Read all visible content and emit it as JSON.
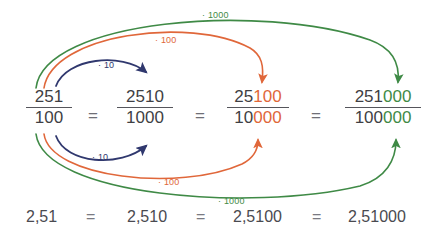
{
  "figure": {
    "colors": {
      "text": "#3f3f44",
      "equals": "#6f6f76",
      "blue": "#30386e",
      "orange": "#e0673a",
      "green": "#3f8a46",
      "background": "#ffffff"
    }
  },
  "fractions": [
    {
      "num_plain": "251",
      "num_colored": "",
      "num_color": "",
      "den_plain": "100",
      "den_colored": "",
      "den_color": ""
    },
    {
      "num_plain": "2510",
      "num_colored": "",
      "num_color": "",
      "den_plain": "1000",
      "den_colored": "",
      "den_color": ""
    },
    {
      "num_plain": "25",
      "num_colored": "100",
      "num_color": "orange",
      "den_plain": "10",
      "den_colored": "000",
      "den_color": "orange"
    },
    {
      "num_plain": "251",
      "num_colored": "000",
      "num_color": "green",
      "den_plain": "100",
      "den_colored": "000",
      "den_color": "green"
    }
  ],
  "equals_signs": [
    "=",
    "=",
    "="
  ],
  "decimals": [
    "2,51",
    "2,510",
    "2,5100",
    "2,51000"
  ],
  "decimal_equals": [
    "=",
    "=",
    "="
  ],
  "arc_labels": {
    "top_blue": "· 10",
    "top_orange": "· 100",
    "top_green": "· 1000",
    "bottom_blue": "· 10",
    "bottom_orange": "· 100",
    "bottom_green": "· 1000"
  }
}
